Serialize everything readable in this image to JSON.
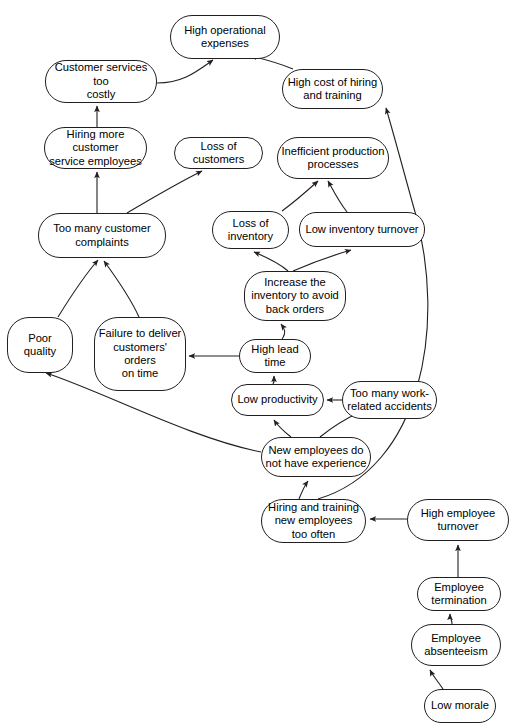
{
  "diagram": {
    "type": "causal-loop-diagram",
    "canvas": {
      "width": 517,
      "height": 728
    },
    "style": {
      "node_fill": "#ffffff",
      "node_stroke": "#231f20",
      "edge_stroke": "#231f20",
      "text_color": "#000000",
      "background": "#ffffff"
    },
    "nodes": [
      {
        "id": "high-operational-expenses",
        "label": "High operational\nexpenses",
        "x": 170,
        "y": 15,
        "w": 110,
        "h": 44,
        "r": 22
      },
      {
        "id": "customer-services-too-costly",
        "label": "Customer services too\ncostly",
        "x": 45,
        "y": 60,
        "w": 112,
        "h": 43,
        "r": 21
      },
      {
        "id": "high-cost-of-hiring-and-training",
        "label": "High cost of hiring\nand training",
        "x": 282,
        "y": 69,
        "w": 101,
        "h": 40,
        "r": 20
      },
      {
        "id": "hiring-more-customer-service-employees",
        "label": "Hiring more customer\nservice employees",
        "x": 44,
        "y": 127,
        "w": 103,
        "h": 42,
        "r": 21
      },
      {
        "id": "loss-of-customers",
        "label": "Loss of customers",
        "x": 174,
        "y": 137,
        "w": 89,
        "h": 32,
        "r": 16
      },
      {
        "id": "inefficient-production-processes",
        "label": "Inefficient production\nprocesses",
        "x": 277,
        "y": 137,
        "w": 112,
        "h": 42,
        "r": 21
      },
      {
        "id": "too-many-customer-complaints",
        "label": "Too many customer\ncomplaints",
        "x": 38,
        "y": 213,
        "w": 128,
        "h": 45,
        "r": 22
      },
      {
        "id": "loss-of-inventory",
        "label": "Loss of\ninventory",
        "x": 212,
        "y": 211,
        "w": 77,
        "h": 38,
        "r": 19
      },
      {
        "id": "low-inventory-turnover",
        "label": "Low inventory turnover",
        "x": 299,
        "y": 212,
        "w": 126,
        "h": 35,
        "r": 17
      },
      {
        "id": "increase-the-inventory-to-avoid-back-orders",
        "label": "Increase the\ninventory to avoid\nback orders",
        "x": 244,
        "y": 271,
        "w": 102,
        "h": 50,
        "r": 22
      },
      {
        "id": "poor-quality",
        "label": "Poor quality",
        "x": 7,
        "y": 317,
        "w": 66,
        "h": 56,
        "r": 22
      },
      {
        "id": "failure-to-deliver-customers-orders-on-time",
        "label": "Failure to deliver\ncustomers' orders\non time",
        "x": 94,
        "y": 317,
        "w": 92,
        "h": 74,
        "r": 24
      },
      {
        "id": "high-lead-time",
        "label": "High lead\ntime",
        "x": 239,
        "y": 339,
        "w": 72,
        "h": 34,
        "r": 17
      },
      {
        "id": "low-productivity",
        "label": "Low productivity",
        "x": 231,
        "y": 384,
        "w": 93,
        "h": 32,
        "r": 16
      },
      {
        "id": "too-many-work-related-accidents",
        "label": "Too many work-\nrelated accidents",
        "x": 342,
        "y": 381,
        "w": 95,
        "h": 38,
        "r": 19
      },
      {
        "id": "new-employees-do-not-have-experience",
        "label": "New employees do\nnot have experience",
        "x": 261,
        "y": 437,
        "w": 110,
        "h": 40,
        "r": 20
      },
      {
        "id": "hiring-and-training-new-employees-too-often",
        "label": "Hiring and training\nnew employees\ntoo often",
        "x": 261,
        "y": 499,
        "w": 105,
        "h": 44,
        "r": 22
      },
      {
        "id": "high-employee-turnover",
        "label": "High employee\nturnover",
        "x": 407,
        "y": 499,
        "w": 102,
        "h": 42,
        "r": 21
      },
      {
        "id": "employee-termination",
        "label": "Employee\ntermination",
        "x": 417,
        "y": 577,
        "w": 84,
        "h": 34,
        "r": 17
      },
      {
        "id": "employee-absenteeism",
        "label": "Employee\nabsenteeism",
        "x": 411,
        "y": 624,
        "w": 90,
        "h": 42,
        "r": 21
      },
      {
        "id": "low-morale",
        "label": "Low morale",
        "x": 424,
        "y": 689,
        "w": 72,
        "h": 34,
        "r": 17
      }
    ],
    "edges": [
      {
        "id": "edge-customer-services-to-expenses",
        "from": "customer-services-too-costly",
        "to": "high-operational-expenses"
      },
      {
        "id": "edge-high-cost-hiring-to-expenses",
        "from": "high-cost-of-hiring-and-training",
        "to": "high-operational-expenses"
      },
      {
        "id": "edge-hiring-more-to-customer-services",
        "from": "hiring-more-customer-service-employees",
        "to": "customer-services-too-costly"
      },
      {
        "id": "edge-complaints-to-hiring-more",
        "from": "too-many-customer-complaints",
        "to": "hiring-more-customer-service-employees"
      },
      {
        "id": "edge-complaints-to-loss-of-customers",
        "from": "too-many-customer-complaints",
        "to": "loss-of-customers"
      },
      {
        "id": "edge-poor-quality-to-complaints",
        "from": "poor-quality",
        "to": "too-many-customer-complaints"
      },
      {
        "id": "edge-failure-deliver-to-complaints",
        "from": "failure-to-deliver-customers-orders-on-time",
        "to": "too-many-customer-complaints"
      },
      {
        "id": "edge-loss-inventory-to-inefficient",
        "from": "loss-of-inventory",
        "to": "inefficient-production-processes"
      },
      {
        "id": "edge-low-turnover-to-inefficient",
        "from": "low-inventory-turnover",
        "to": "inefficient-production-processes"
      },
      {
        "id": "edge-increase-inventory-to-loss-inventory",
        "from": "increase-the-inventory-to-avoid-back-orders",
        "to": "loss-of-inventory"
      },
      {
        "id": "edge-increase-inventory-to-low-turnover",
        "from": "increase-the-inventory-to-avoid-back-orders",
        "to": "low-inventory-turnover"
      },
      {
        "id": "edge-high-lead-time-to-increase-inventory",
        "from": "high-lead-time",
        "to": "increase-the-inventory-to-avoid-back-orders"
      },
      {
        "id": "edge-high-lead-time-to-failure-deliver",
        "from": "high-lead-time",
        "to": "failure-to-deliver-customers-orders-on-time"
      },
      {
        "id": "edge-low-productivity-to-high-lead-time",
        "from": "low-productivity",
        "to": "high-lead-time"
      },
      {
        "id": "edge-accidents-to-low-productivity",
        "from": "too-many-work-related-accidents",
        "to": "low-productivity"
      },
      {
        "id": "edge-new-employees-to-low-productivity",
        "from": "new-employees-do-not-have-experience",
        "to": "low-productivity"
      },
      {
        "id": "edge-new-employees-to-accidents",
        "from": "new-employees-do-not-have-experience",
        "to": "too-many-work-related-accidents"
      },
      {
        "id": "edge-new-employees-to-poor-quality",
        "from": "new-employees-do-not-have-experience",
        "to": "poor-quality"
      },
      {
        "id": "edge-hiring-training-to-new-employees",
        "from": "hiring-and-training-new-employees-too-often",
        "to": "new-employees-do-not-have-experience"
      },
      {
        "id": "edge-hiring-training-to-high-cost-hiring",
        "from": "hiring-and-training-new-employees-too-often",
        "to": "high-cost-of-hiring-and-training"
      },
      {
        "id": "edge-turnover-to-hiring-training",
        "from": "high-employee-turnover",
        "to": "hiring-and-training-new-employees-too-often"
      },
      {
        "id": "edge-termination-to-turnover",
        "from": "employee-termination",
        "to": "high-employee-turnover"
      },
      {
        "id": "edge-absenteeism-to-termination",
        "from": "employee-absenteeism",
        "to": "employee-termination"
      },
      {
        "id": "edge-low-morale-to-absenteeism",
        "from": "low-morale",
        "to": "employee-absenteeism"
      }
    ],
    "edge_paths": {
      "edge-customer-services-to-expenses": "M157,83 C183,83 196,72 213,60",
      "edge-high-cost-hiring-to-expenses": "M293,69 C281,64 268,60 251,56",
      "edge-hiring-more-to-customer-services": "M97,127 L97,106",
      "edge-complaints-to-hiring-more": "M97,213 L97,172",
      "edge-complaints-to-loss-of-customers": "M127,213 C159,194 182,181 202,171",
      "edge-poor-quality-to-complaints": "M58,317 C71,296 84,276 98,260",
      "edge-failure-deliver-to-complaints": "M139,317 C129,295 115,276 104,261",
      "edge-loss-inventory-to-inefficient": "M282,211 C297,200 308,190 318,181",
      "edge-low-turnover-to-inefficient": "M347,212 C339,202 334,192 328,181",
      "edge-increase-inventory-to-loss-inventory": "M288,271 C279,263 266,257 254,252",
      "edge-increase-inventory-to-low-turnover": "M293,271 C307,265 327,257 351,250",
      "edge-high-lead-time-to-increase-inventory": "M282,339 C287,332 284,328 281,324",
      "edge-high-lead-time-to-failure-deliver": "M239,356 L189,356",
      "edge-low-productivity-to-high-lead-time": "M273,384 C275,381 274,380 274,376",
      "edge-accidents-to-low-productivity": "M342,400 L327,400",
      "edge-new-employees-to-low-productivity": "M291,437 C282,430 278,426 274,420",
      "edge-new-employees-to-accidents": "M320,437 C331,428 345,419 360,412",
      "edge-new-employees-to-poor-quality": "M261,452 C190,438 104,392 46,373",
      "edge-hiring-training-to-new-employees": "M299,499 C303,489 305,485 308,481",
      "edge-hiring-training-to-high-cost-hiring": "M318,499 C421,468 447,327 415,212 C403,169 394,135 386,108",
      "edge-turnover-to-hiring-training": "M407,519 L370,519",
      "edge-termination-to-turnover": "M458,577 C458,570 458,563 458,545",
      "edge-absenteeism-to-termination": "M452,624 C452,620 450,618 450,614",
      "edge-low-morale-to-absenteeism": "M443,689 C437,680 433,676 430,670"
    }
  }
}
